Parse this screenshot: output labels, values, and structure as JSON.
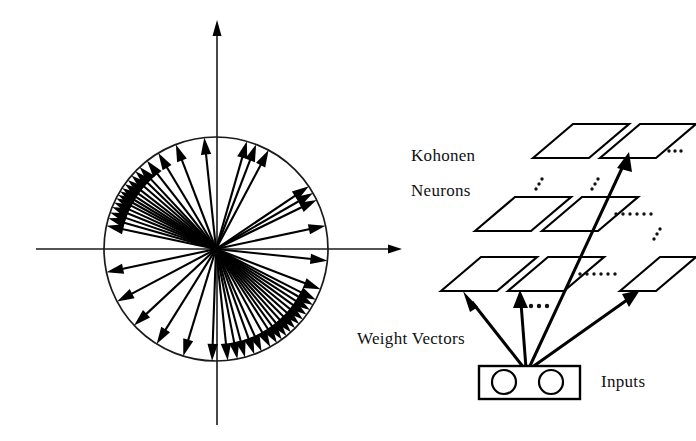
{
  "figure": {
    "background_color": "#ffffff",
    "ink_color": "#000000",
    "width": 696,
    "height": 441
  },
  "labels": {
    "kohonen": "Kohonen",
    "neurons": "Neurons",
    "weight_vectors": "Weight  Vectors",
    "inputs": "Inputs",
    "ellipsis": "...",
    "ellipsis_long": "......"
  },
  "chart_data": {
    "type": "scatter",
    "subtype": "polar-vector-plot",
    "title": "Weight Vectors",
    "xlabel": "",
    "ylabel": "",
    "grid": false,
    "legend": null,
    "axes": {
      "show_x_axis": true,
      "show_y_axis": true,
      "x_axis_pixel_range": [
        36,
        400
      ],
      "y_axis_pixel_range": [
        22,
        425
      ],
      "x_arrowhead": "right",
      "y_arrowhead": "up"
    },
    "unit_circle": {
      "center_x": 216,
      "center_y": 249,
      "radius": 112,
      "stroke": "#1a1a1a"
    },
    "value_units": "degrees (counter-clockwise from positive x-axis)",
    "magnitude": 1.0,
    "angles_deg": [
      96,
      111,
      121,
      128,
      133,
      136,
      139,
      142,
      144.5,
      147,
      149,
      151,
      153,
      155.5,
      158,
      161,
      164,
      168,
      62,
      69,
      74,
      34,
      30,
      26,
      12,
      -6,
      -21,
      -27,
      -30,
      -33,
      -36,
      -39,
      -42,
      -45,
      -48,
      -51,
      -54,
      -57,
      -61,
      -66,
      -70,
      -75,
      -79,
      -84,
      -92,
      -107,
      -122,
      -137,
      -152,
      -168
    ],
    "cluster_summary": [
      {
        "name": "upper-left cluster",
        "angle_range_deg": [
          128,
          168
        ],
        "count": 16
      },
      {
        "name": "upper-right sparse",
        "angle_range_deg": [
          12,
          96
        ],
        "count": 8
      },
      {
        "name": "lower-right cluster",
        "angle_range_deg": [
          -84,
          -21
        ],
        "count": 19
      },
      {
        "name": "lower-left sparse",
        "angle_range_deg": [
          -168,
          -92
        ],
        "count": 6
      }
    ]
  },
  "network": {
    "name": "kohonen-layer-3d",
    "rows": [
      {
        "row_index": 0,
        "row_name": "top-row",
        "cells": 2,
        "trailing_ellipsis": "..."
      },
      {
        "row_index": 1,
        "row_name": "middle-row",
        "cells": 2,
        "trailing_ellipsis": "......"
      },
      {
        "row_index": 2,
        "row_name": "bottom-row",
        "cells": 3,
        "trailing_ellipsis": "......"
      }
    ],
    "inter_row_ellipses": 3,
    "weight_vector_arrows": 4,
    "input_layer": {
      "name": "input-node-box",
      "node_count": 2,
      "shape": "rectangle-with-circles"
    }
  }
}
